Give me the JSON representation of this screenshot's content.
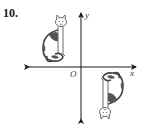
{
  "problem": {
    "number": "10."
  },
  "axes": {
    "x_label": "x",
    "y_label": "y",
    "origin_label": "O"
  },
  "figures": [
    {
      "name": "cat-original",
      "quadrant": "II",
      "orientation": "upright"
    },
    {
      "name": "cat-rotated",
      "quadrant": "IV",
      "orientation": "rotated 180° about origin"
    }
  ],
  "colors": {
    "axis": "#1a1a1a",
    "outline": "#444444",
    "patch": "#555555"
  }
}
